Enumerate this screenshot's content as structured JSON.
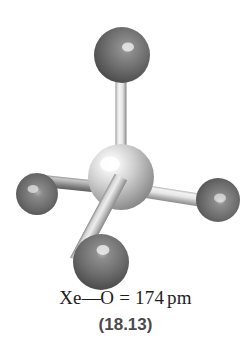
{
  "figure": {
    "kind": "ball-and-stick-molecular-model",
    "molecule_name": "XeO4",
    "caption": {
      "bond_length_text": "Xe—O = 174 pm",
      "bond_length_parts": {
        "central_atom": "Xe",
        "dash": "—",
        "ligand_atom": "O",
        "equals": "=",
        "value": "174",
        "unit": "pm"
      },
      "figure_number": "(18.13)"
    },
    "colors": {
      "background": "#ffffff",
      "central_atom_base": "#b9b9b9",
      "central_atom_light": "#f2f2f2",
      "central_atom_dark": "#777777",
      "ligand_atom_base": "#6e6e6e",
      "ligand_atom_light": "#d8d8d8",
      "ligand_atom_dark": "#2f2f2f",
      "bond_light": "#ededed",
      "bond_mid": "#b5b5b5",
      "bond_dark": "#7a7a7a",
      "caption_text": "#1d1d1d",
      "figure_number_text": "#4a4a4a"
    },
    "atoms": [
      {
        "id": "central-xenon",
        "element": "Xe",
        "role": "central",
        "cx": 121,
        "cy": 177,
        "r": 33,
        "shade": "light"
      },
      {
        "id": "oxygen-top",
        "element": "O",
        "role": "ligand",
        "cx": 122,
        "cy": 55,
        "r": 28,
        "shade": "dark"
      },
      {
        "id": "oxygen-left",
        "element": "O",
        "role": "ligand",
        "cx": 37,
        "cy": 194,
        "r": 21,
        "shade": "dark"
      },
      {
        "id": "oxygen-right",
        "element": "O",
        "role": "ligand",
        "cx": 218,
        "cy": 200,
        "r": 22,
        "shade": "dark"
      },
      {
        "id": "oxygen-bottom",
        "element": "O",
        "role": "ligand",
        "cx": 101,
        "cy": 262,
        "r": 28,
        "shade": "dark"
      }
    ],
    "bonds": [
      {
        "id": "bond-top",
        "from": "central-xenon",
        "to": "oxygen-top",
        "width": 10,
        "shade": "light"
      },
      {
        "id": "bond-left",
        "from": "central-xenon",
        "to": "oxygen-left",
        "width": 11,
        "shade": "dark"
      },
      {
        "id": "bond-right",
        "from": "central-xenon",
        "to": "oxygen-right",
        "width": 12,
        "shade": "light"
      },
      {
        "id": "bond-bottom",
        "from": "central-xenon",
        "to": "oxygen-bottom",
        "width": 13,
        "shade": "mid"
      }
    ]
  }
}
